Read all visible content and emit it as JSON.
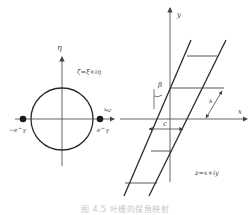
{
  "figure": {
    "caption": "图 4.5 叶栅的保角映射",
    "caption_note": "caption is faint and clipped; text approximated"
  },
  "left_panel": {
    "plane_label": "ζ=ξ+iη",
    "axis_vertical": "η",
    "axis_horizontal": "ξ",
    "point_left": "−e^γ",
    "point_right": "e^γ",
    "shape": "unit circle with two singular points on ξ-axis"
  },
  "right_panel": {
    "plane_label": "z=x+iy",
    "axis_vertical": "y",
    "axis_horizontal": "x",
    "stagger_angle": "β",
    "pitch": "s",
    "chord_spacing": "c",
    "shape": "cascade of parallel inclined lines with horizontal rungs"
  },
  "colors": {
    "line": "#2a2a2a",
    "axis": "#555555",
    "caption": "#c8c8c8"
  }
}
